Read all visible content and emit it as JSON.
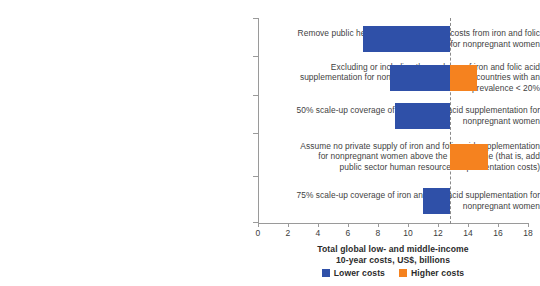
{
  "chart_data": {
    "type": "bar",
    "orientation": "horizontal",
    "subtype": "tornado",
    "title": "",
    "xlabel": "Total global low- and middle-income 10-year costs, US$, billions",
    "xlabel_line1": "Total global low- and middle-income",
    "xlabel_line2": "10-year costs, US$, billions",
    "ylabel": "",
    "xlim": [
      0,
      18
    ],
    "xticks": [
      0,
      2,
      4,
      6,
      8,
      10,
      12,
      14,
      16,
      18
    ],
    "xtick_labels": [
      "0",
      "2",
      "4",
      "6",
      "8",
      "10",
      "12",
      "14",
      "16",
      "18"
    ],
    "grid": false,
    "baseline_value": 12.8,
    "legend_position": "bottom",
    "legend": [
      {
        "name": "Lower costs",
        "color": "#2f50a8"
      },
      {
        "name": "Higher costs",
        "color": "#f5821f"
      }
    ],
    "categories": [
      "Remove public health system personnel costs from iron and folic acid supplementation for nonpregnant women",
      "Excluding or including the scale-up of iron and folic acid supplementation for nonpregnant women in all countries with an anemia prevalence < 20%",
      "50% scale-up coverage of iron and folic acid supplementation for nonpregnant women",
      "Assume no private supply of iron and folic acid supplementation for nonpregnant women above the poverty line (that is, add public sector human resources/implementation costs)",
      "75% scale-up coverage of iron and folic acid supplementation for nonpregnant women"
    ],
    "bars": [
      {
        "category_index": 0,
        "lower": 7.0,
        "higher": 12.8
      },
      {
        "category_index": 1,
        "lower": 8.8,
        "higher": 14.6
      },
      {
        "category_index": 2,
        "lower": 9.1,
        "higher": 12.8
      },
      {
        "category_index": 3,
        "lower": 12.8,
        "higher": 15.3
      },
      {
        "category_index": 4,
        "lower": 11.0,
        "higher": 12.8
      }
    ],
    "series": [
      {
        "name": "Lower costs",
        "color": "#2f50a8",
        "values": [
          7.0,
          8.8,
          9.1,
          12.8,
          11.0
        ]
      },
      {
        "name": "Higher costs",
        "color": "#f5821f",
        "values": [
          12.8,
          14.6,
          12.8,
          15.3,
          12.8
        ]
      }
    ]
  },
  "colors": {
    "lower": "#2f50a8",
    "higher": "#f5821f",
    "axis": "#9a9a9a",
    "text": "#3b3b3b",
    "reference_line": "#8a8a8a"
  }
}
